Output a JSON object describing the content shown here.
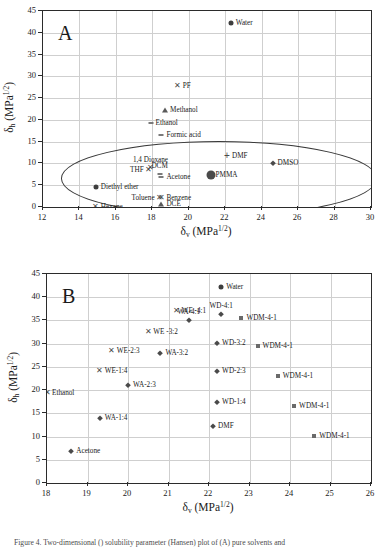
{
  "figure": {
    "caption": "Figure 4. Two-dimensional () solubility parameter (Hansen) plot of (A) pure solvents and"
  },
  "axis_titles": {
    "x_delta": "δ",
    "x_sub": "v",
    "x_unit": " (MPa",
    "x_sup": "1/2",
    "x_close": ")",
    "y_delta": "δ",
    "y_sub": "h",
    "y_unit": " (MPa",
    "y_sup": "1/2",
    "y_close": ")"
  },
  "chart_data": [
    {
      "type": "scatter",
      "panel": "A",
      "title": "A",
      "xlabel": "δv (MPa1/2)",
      "ylabel": "δh (MPa1/2)",
      "xlim": [
        12,
        30
      ],
      "ylim": [
        0,
        45
      ],
      "xticks": [
        12,
        14,
        16,
        18,
        20,
        22,
        24,
        26,
        28,
        30
      ],
      "yticks": [
        0,
        5,
        10,
        15,
        20,
        25,
        30,
        35,
        40,
        45
      ],
      "grid": true,
      "legend": "none",
      "annotation": "ellipse enclosing PMMA-compatible solvent cluster",
      "points": [
        {
          "label": "Water",
          "x": 22.3,
          "y": 42.3,
          "marker": "circle",
          "label_pos": "right"
        },
        {
          "label": "PF",
          "x": 19.4,
          "y": 27.9,
          "marker": "x",
          "label_pos": "right"
        },
        {
          "label": "Methanol",
          "x": 18.7,
          "y": 22.3,
          "marker": "triangle",
          "label_pos": "right"
        },
        {
          "label": "Ethanol",
          "x": 17.9,
          "y": 19.4,
          "marker": "bar",
          "label_pos": "right"
        },
        {
          "label": "Formic acid",
          "x": 18.5,
          "y": 16.6,
          "marker": "bar",
          "label_pos": "right"
        },
        {
          "label": "DMF",
          "x": 22.1,
          "y": 11.7,
          "marker": "plus",
          "label_pos": "right"
        },
        {
          "label": "DMSO",
          "x": 24.6,
          "y": 10.2,
          "marker": "diamond",
          "label_pos": "right"
        },
        {
          "label": "1,4 Dioxane",
          "x": 17.9,
          "y": 8.9,
          "marker": "x",
          "label_pos": "above"
        },
        {
          "label": "THF",
          "x": 17.8,
          "y": 8.4,
          "marker": "x",
          "label_pos": "left"
        },
        {
          "label": "DCM",
          "x": 18.4,
          "y": 7.6,
          "marker": "bar",
          "label_pos": "above"
        },
        {
          "label": "Acetone",
          "x": 18.5,
          "y": 7.0,
          "marker": "bar",
          "label_pos": "right"
        },
        {
          "label": "PMMA",
          "x": 21.2,
          "y": 7.3,
          "marker": "bigcircle",
          "label_pos": "right"
        },
        {
          "label": "Diethyl ether",
          "x": 14.9,
          "y": 4.6,
          "marker": "circle",
          "label_pos": "right"
        },
        {
          "label": "Toluene",
          "x": 18.4,
          "y": 2.1,
          "marker": "x",
          "label_pos": "left"
        },
        {
          "label": "Benzene",
          "x": 18.5,
          "y": 2.0,
          "marker": "x",
          "label_pos": "right"
        },
        {
          "label": "DCE",
          "x": 18.5,
          "y": 0.6,
          "marker": "triangle",
          "label_pos": "right"
        },
        {
          "label": "Hexane",
          "x": 14.9,
          "y": 0.1,
          "marker": "x",
          "label_pos": "right"
        }
      ]
    },
    {
      "type": "scatter",
      "panel": "B",
      "title": "B",
      "xlabel": "δv (MPa1/2)",
      "ylabel": "δh (MPa1/2)",
      "xlim": [
        18,
        26
      ],
      "ylim": [
        0,
        45
      ],
      "xticks": [
        18,
        19,
        20,
        21,
        22,
        23,
        24,
        25,
        26
      ],
      "yticks": [
        0,
        5,
        10,
        15,
        20,
        25,
        30,
        35,
        40,
        45
      ],
      "grid": true,
      "legend": "none",
      "points": [
        {
          "label": "Water",
          "x": 22.3,
          "y": 42.3,
          "marker": "circle",
          "label_pos": "right"
        },
        {
          "label": "WE -4:1",
          "x": 21.2,
          "y": 37.0,
          "marker": "x",
          "label_pos": "right"
        },
        {
          "label": "WD-4:1",
          "x": 22.3,
          "y": 36.3,
          "marker": "diamond",
          "label_pos": "above"
        },
        {
          "label": "WDM-4-1",
          "x": 22.8,
          "y": 35.6,
          "marker": "square",
          "label_pos": "right"
        },
        {
          "label": "WA-4:1",
          "x": 21.5,
          "y": 35.2,
          "marker": "diamond",
          "label_pos": "above"
        },
        {
          "label": "WE -3:2",
          "x": 20.5,
          "y": 32.5,
          "marker": "x",
          "label_pos": "right"
        },
        {
          "label": "WD-3:2",
          "x": 22.2,
          "y": 30.1,
          "marker": "diamond",
          "label_pos": "right"
        },
        {
          "label": "WDM-4-1",
          "x": 23.2,
          "y": 29.6,
          "marker": "square",
          "label_pos": "right"
        },
        {
          "label": "WE-2:3",
          "x": 19.6,
          "y": 28.4,
          "marker": "x",
          "label_pos": "right"
        },
        {
          "label": "WA-3:2",
          "x": 20.8,
          "y": 28.1,
          "marker": "diamond",
          "label_pos": "right"
        },
        {
          "label": "WE-1:4",
          "x": 19.3,
          "y": 24.2,
          "marker": "x",
          "label_pos": "right"
        },
        {
          "label": "WD-2:3",
          "x": 22.2,
          "y": 24.1,
          "marker": "diamond",
          "label_pos": "right"
        },
        {
          "label": "WDM-4-1",
          "x": 23.7,
          "y": 23.0,
          "marker": "square",
          "label_pos": "right"
        },
        {
          "label": "WA-2:3",
          "x": 20.0,
          "y": 21.2,
          "marker": "diamond",
          "label_pos": "right"
        },
        {
          "label": "Ethanol",
          "x": 18.0,
          "y": 19.4,
          "marker": "x",
          "label_pos": "right"
        },
        {
          "label": "WD-1:4",
          "x": 22.2,
          "y": 17.4,
          "marker": "diamond",
          "label_pos": "right"
        },
        {
          "label": "WDM-4-1",
          "x": 24.1,
          "y": 16.5,
          "marker": "square",
          "label_pos": "right"
        },
        {
          "label": "WA-1:4",
          "x": 19.3,
          "y": 14.1,
          "marker": "diamond",
          "label_pos": "right"
        },
        {
          "label": "DMF",
          "x": 22.1,
          "y": 12.3,
          "marker": "diamond",
          "label_pos": "right"
        },
        {
          "label": "WDM-4-1",
          "x": 24.6,
          "y": 10.2,
          "marker": "square",
          "label_pos": "right"
        },
        {
          "label": "Acetone",
          "x": 18.6,
          "y": 7.0,
          "marker": "diamond",
          "label_pos": "right"
        }
      ]
    }
  ]
}
